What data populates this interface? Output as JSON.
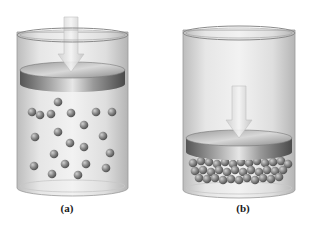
{
  "figure": {
    "panels": [
      {
        "id": "a",
        "label": "(a)",
        "cylinder": {
          "x": 17,
          "rim_y": 32,
          "width": 111,
          "bottom_y": 188
        },
        "piston": {
          "top_y": 62,
          "thickness": 14
        },
        "arrow": {
          "x": 71,
          "top_y": 17,
          "tip_y": 72
        },
        "molecules": [
          [
            32,
            112
          ],
          [
            40,
            115
          ],
          [
            51,
            114
          ],
          [
            58,
            102
          ],
          [
            71,
            113
          ],
          [
            96,
            112
          ],
          [
            112,
            112
          ],
          [
            84,
            125
          ],
          [
            35,
            137
          ],
          [
            58,
            132
          ],
          [
            70,
            143
          ],
          [
            84,
            147
          ],
          [
            103,
            136
          ],
          [
            54,
            154
          ],
          [
            110,
            153
          ],
          [
            34,
            166
          ],
          [
            65,
            164
          ],
          [
            86,
            164
          ],
          [
            106,
            168
          ],
          [
            52,
            174
          ],
          [
            78,
            175
          ]
        ]
      },
      {
        "id": "b",
        "label": "(b)",
        "cylinder": {
          "x": 183,
          "rim_y": 30,
          "width": 112,
          "bottom_y": 190
        },
        "piston": {
          "top_y": 130,
          "thickness": 14
        },
        "arrow": {
          "x": 239,
          "top_y": 86,
          "tip_y": 138
        },
        "molecules": [
          [
            193,
            163
          ],
          [
            201,
            161
          ],
          [
            209,
            162
          ],
          [
            217,
            164
          ],
          [
            225,
            162
          ],
          [
            233,
            164
          ],
          [
            241,
            162
          ],
          [
            249,
            163
          ],
          [
            257,
            161
          ],
          [
            265,
            163
          ],
          [
            273,
            162
          ],
          [
            281,
            161
          ],
          [
            288,
            164
          ],
          [
            195,
            171
          ],
          [
            203,
            170
          ],
          [
            211,
            172
          ],
          [
            219,
            170
          ],
          [
            227,
            172
          ],
          [
            235,
            170
          ],
          [
            243,
            172
          ],
          [
            251,
            170
          ],
          [
            259,
            172
          ],
          [
            267,
            170
          ],
          [
            275,
            171
          ],
          [
            283,
            170
          ],
          [
            199,
            178
          ],
          [
            207,
            179
          ],
          [
            215,
            178
          ],
          [
            223,
            180
          ],
          [
            231,
            179
          ],
          [
            239,
            180
          ],
          [
            247,
            178
          ],
          [
            255,
            180
          ],
          [
            263,
            178
          ],
          [
            271,
            179
          ],
          [
            279,
            177
          ]
        ]
      }
    ],
    "colors": {
      "glass": "#d9d9d9",
      "glass_edge": "#9a9a9a",
      "piston_top": "#b8b8b8",
      "piston_side": "#6e6e6e",
      "molecule": "#7a7a7a",
      "arrow": "#e0e0e0"
    }
  }
}
